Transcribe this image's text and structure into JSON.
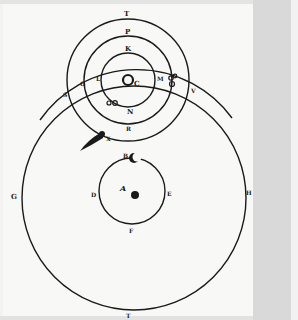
{
  "diagram": {
    "colors": {
      "ink": "#1a1a1a",
      "paper": "#f8f8f7",
      "gutter": "#d9d9d9"
    },
    "labels": {
      "T_top": "T",
      "P": "P",
      "K_top": "K",
      "C": "C",
      "L": "L",
      "O": "O",
      "S": "S",
      "M": "M",
      "V": "V",
      "N": "N",
      "R": "R",
      "X": "X",
      "B": "B",
      "A": "A",
      "D": "D",
      "E": "E",
      "F": "F",
      "G": "G",
      "H": "H",
      "T_bottom": "T"
    },
    "symbols": {
      "sun": "sun-symbol",
      "earth": "earth-dot",
      "moon": "☾",
      "comet": "comet",
      "mars": "♂",
      "venus": "♀",
      "mercury": "☿",
      "jupiter": "♃"
    }
  }
}
